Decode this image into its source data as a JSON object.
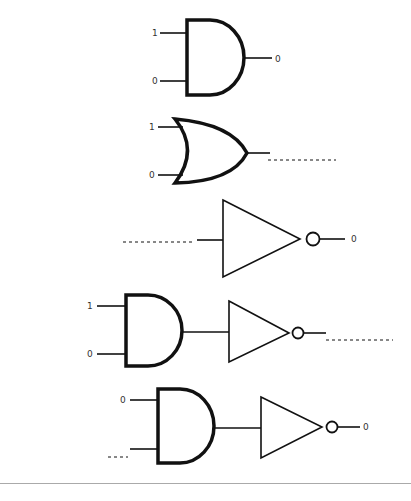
{
  "diagram": {
    "type": "logic-gate-exercises",
    "colors": {
      "stroke": "#111111",
      "label": "#333333",
      "divider": "#aaaaaa",
      "background": "#ffffff"
    },
    "gates": [
      {
        "id": "g1",
        "kind": "AND",
        "inputs": [
          "1",
          "0"
        ],
        "output": "0"
      },
      {
        "id": "g2",
        "kind": "OR",
        "inputs": [
          "1",
          "0"
        ],
        "output": ""
      },
      {
        "id": "g3",
        "kind": "NOT",
        "inputs": [
          ""
        ],
        "output": "0"
      },
      {
        "id": "g4",
        "kind": "NAND (AND + NOT)",
        "inputs": [
          "1",
          "0"
        ],
        "output": ""
      },
      {
        "id": "g5",
        "kind": "NAND (AND + NOT)",
        "inputs": [
          "0",
          ""
        ],
        "output": "0"
      }
    ],
    "labels": {
      "g1_in_a": "1",
      "g1_in_b": "0",
      "g1_out": "0",
      "g2_in_a": "1",
      "g2_in_b": "0",
      "g3_out": "0",
      "g4_in_a": "1",
      "g4_in_b": "0",
      "g5_in_a": "0",
      "g5_out": "0"
    }
  }
}
